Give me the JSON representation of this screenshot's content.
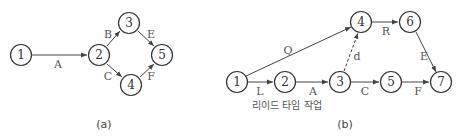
{
  "diagram_a": {
    "caption": "(a)",
    "nodes": [
      {
        "id": "1",
        "label": "1",
        "x": 21,
        "y": 55
      },
      {
        "id": "2",
        "label": "2",
        "x": 99,
        "y": 55
      },
      {
        "id": "3",
        "label": "3",
        "x": 129,
        "y": 23
      },
      {
        "id": "4",
        "label": "4",
        "x": 131,
        "y": 85
      },
      {
        "id": "5",
        "label": "5",
        "x": 162,
        "y": 55
      }
    ],
    "edges": [
      {
        "from": "1",
        "to": "2",
        "label": "A",
        "dashed": false
      },
      {
        "from": "2",
        "to": "3",
        "label": "B",
        "dashed": false
      },
      {
        "from": "2",
        "to": "4",
        "label": "C",
        "dashed": false
      },
      {
        "from": "3",
        "to": "5",
        "label": "E",
        "dashed": false
      },
      {
        "from": "4",
        "to": "5",
        "label": "F",
        "dashed": false
      }
    ]
  },
  "diagram_b": {
    "caption": "(b)",
    "note": "리이드 타임 작업",
    "nodes": [
      {
        "id": "1",
        "label": "1",
        "x": 237,
        "y": 82
      },
      {
        "id": "2",
        "label": "2",
        "x": 285,
        "y": 82
      },
      {
        "id": "3",
        "label": "3",
        "x": 340,
        "y": 82
      },
      {
        "id": "4",
        "label": "4",
        "x": 361,
        "y": 22
      },
      {
        "id": "5",
        "label": "5",
        "x": 391,
        "y": 82
      },
      {
        "id": "6",
        "label": "6",
        "x": 410,
        "y": 22
      },
      {
        "id": "7",
        "label": "7",
        "x": 441,
        "y": 82
      }
    ],
    "edges": [
      {
        "from": "1",
        "to": "4",
        "label": "Q",
        "dashed": false
      },
      {
        "from": "1",
        "to": "2",
        "label": "L",
        "dashed": false
      },
      {
        "from": "2",
        "to": "3",
        "label": "A",
        "dashed": false
      },
      {
        "from": "3",
        "to": "4",
        "label": "d",
        "dashed": true
      },
      {
        "from": "3",
        "to": "5",
        "label": "C",
        "dashed": false
      },
      {
        "from": "4",
        "to": "6",
        "label": "R",
        "dashed": false
      },
      {
        "from": "5",
        "to": "7",
        "label": "F",
        "dashed": false
      },
      {
        "from": "6",
        "to": "7",
        "label": "E",
        "dashed": false
      }
    ]
  }
}
